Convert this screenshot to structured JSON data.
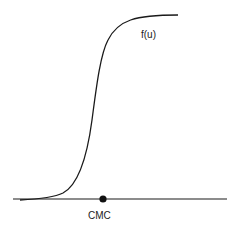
{
  "diagram": {
    "type": "sigmoid-curve-schematic",
    "curve_label": "f(u)",
    "point_label": "CMC",
    "colors": {
      "line": "#1a1a1a",
      "point": "#111111",
      "background": "#ffffff"
    }
  }
}
